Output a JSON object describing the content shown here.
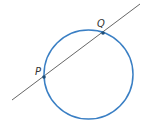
{
  "diagram": {
    "circle": {
      "cx": 88.5,
      "cy": 74.5,
      "r": 44.5,
      "color": "#3a7fc4"
    },
    "line": {
      "x1": 12,
      "y1": 100,
      "x2": 140,
      "y2": 4,
      "color": "#555555"
    },
    "points": [
      {
        "label": "P",
        "x": 44,
        "y": 77,
        "label_x": 35,
        "label_y": 75
      },
      {
        "label": "Q",
        "x": 103,
        "y": 33,
        "label_x": 97,
        "label_y": 27
      }
    ],
    "point_color": "#1f4e79"
  }
}
